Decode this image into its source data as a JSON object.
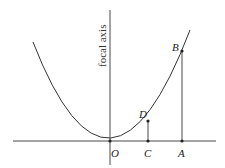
{
  "diagram": {
    "axis_label": "focal axis",
    "points": {
      "O": "O",
      "C": "C",
      "A": "A",
      "D": "D",
      "B": "B"
    },
    "colors": {
      "line": "#333333",
      "text": "#222222",
      "background": "#ffffff"
    }
  }
}
